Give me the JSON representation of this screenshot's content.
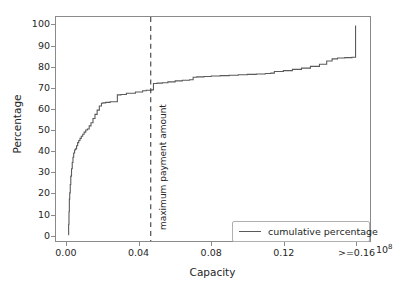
{
  "chart_data": {
    "type": "line",
    "title": "",
    "xlabel": "Capacity",
    "ylabel": "Percentage",
    "xlim": [
      -0.006,
      0.168
    ],
    "ylim": [
      -3,
      104
    ],
    "grid": false,
    "x_offset_text": "10",
    "x_offset_exponent": "8",
    "xticks": [
      0.0,
      0.04,
      0.08,
      0.12,
      0.16
    ],
    "xtick_labels": [
      "0.00",
      "0.04",
      "0.08",
      "0.12",
      ">=0.16"
    ],
    "yticks": [
      0,
      10,
      20,
      30,
      40,
      50,
      60,
      70,
      80,
      90,
      100
    ],
    "ytick_labels": [
      "0",
      "10",
      "20",
      "30",
      "40",
      "50",
      "60",
      "70",
      "80",
      "90",
      "100"
    ],
    "legend": {
      "position": "lower right",
      "entries": [
        {
          "label": "cumulative percentage",
          "color": "#5a5a5a",
          "style": "solid"
        }
      ]
    },
    "annotations": [
      {
        "type": "vline",
        "label": "maximum payment amount",
        "x": 0.0465,
        "style": "dashed",
        "color": "#3c3c3c"
      }
    ],
    "series": [
      {
        "name": "cumulative percentage",
        "color": "#5a5a5a",
        "style": "solid",
        "drawstyle": "steps-post",
        "x": [
          0.0008,
          0.001,
          0.0012,
          0.0014,
          0.0016,
          0.0019,
          0.0022,
          0.0026,
          0.003,
          0.0034,
          0.0038,
          0.0043,
          0.0048,
          0.0054,
          0.006,
          0.0066,
          0.0073,
          0.008,
          0.0088,
          0.0096,
          0.0105,
          0.0114,
          0.0124,
          0.0134,
          0.0145,
          0.0156,
          0.0168,
          0.018,
          0.0192,
          0.02,
          0.0205,
          0.0215,
          0.024,
          0.028,
          0.03,
          0.033,
          0.038,
          0.042,
          0.044,
          0.046,
          0.047,
          0.048,
          0.05,
          0.053,
          0.056,
          0.06,
          0.064,
          0.068,
          0.07,
          0.072,
          0.076,
          0.08,
          0.085,
          0.09,
          0.095,
          0.1,
          0.105,
          0.11,
          0.113,
          0.115,
          0.12,
          0.125,
          0.13,
          0.135,
          0.14,
          0.144,
          0.147,
          0.15,
          0.154,
          0.158,
          0.16,
          0.16
        ],
        "y": [
          0.0,
          5.0,
          11.0,
          17.0,
          20.0,
          24.0,
          28.0,
          31.5,
          34.5,
          37.0,
          39.0,
          40.5,
          41.0,
          42.5,
          44.0,
          45.0,
          46.0,
          47.0,
          48.0,
          49.0,
          50.0,
          50.5,
          52.0,
          53.5,
          55.5,
          57.5,
          59.5,
          61.5,
          62.8,
          63.0,
          63.0,
          63.2,
          63.5,
          66.8,
          67.0,
          67.6,
          68.2,
          68.8,
          69.0,
          69.0,
          69.2,
          72.2,
          72.4,
          72.6,
          73.0,
          73.5,
          73.8,
          74.0,
          75.2,
          75.4,
          75.6,
          75.8,
          76.0,
          76.2,
          76.4,
          76.6,
          76.8,
          77.0,
          77.2,
          78.0,
          78.4,
          79.0,
          79.6,
          80.4,
          81.4,
          83.0,
          84.0,
          84.4,
          84.6,
          84.8,
          84.9,
          100.0
        ]
      }
    ]
  }
}
